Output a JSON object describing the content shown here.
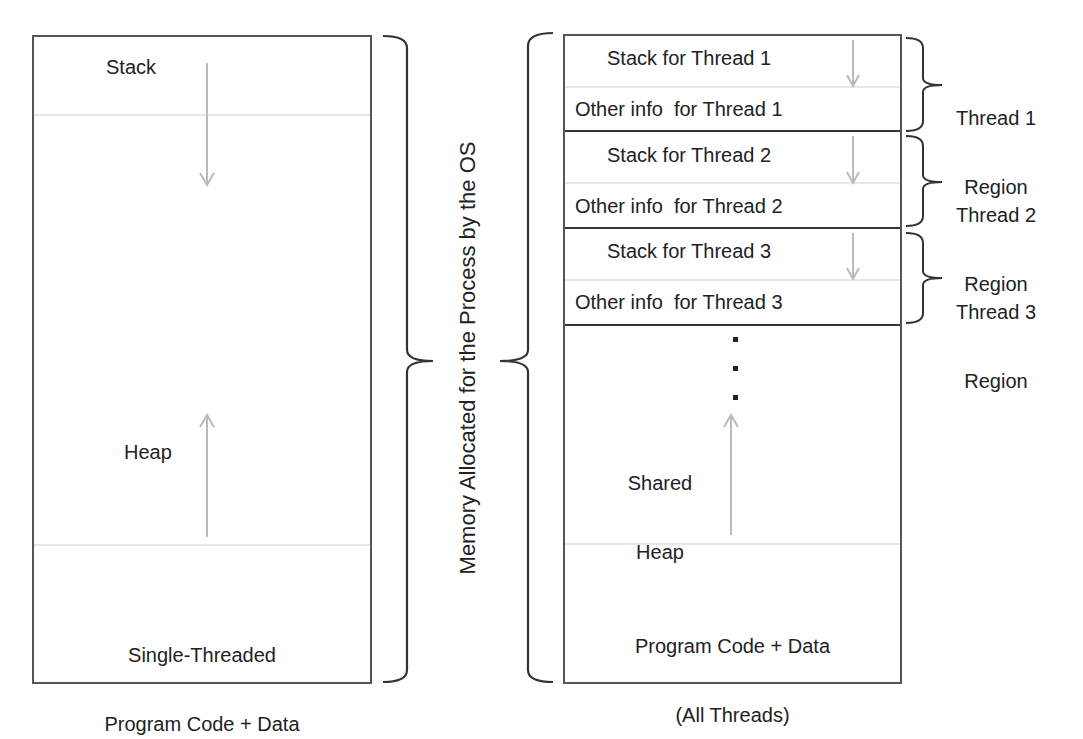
{
  "diagram": {
    "title_vertical": "Memory Allocated for the Process by the OS",
    "single_threaded": {
      "stack_label": "Stack",
      "heap_label": "Heap",
      "code_label_line1": "Single-Threaded",
      "code_label_line2": "Program Code + Data"
    },
    "multi_threaded": {
      "threads": [
        {
          "stack_label": "Stack for Thread 1",
          "other_label": "Other info  for Thread 1",
          "region_line1": "Thread 1",
          "region_line2": "Region"
        },
        {
          "stack_label": "Stack for Thread 2",
          "other_label": "Other info  for Thread 2",
          "region_line1": "Thread 2",
          "region_line2": "Region"
        },
        {
          "stack_label": "Stack for Thread 3",
          "other_label": "Other info  for Thread 3",
          "region_line1": "Thread 3",
          "region_line2": "Region"
        }
      ],
      "ellipsis": "⋮",
      "heap_line1": "Shared",
      "heap_line2": "Heap",
      "code_line1": "Program Code + Data",
      "code_line2": "(All Threads)"
    },
    "colors": {
      "box_border": "#555555",
      "divider_light": "#c8c8c8",
      "thread_border": "#333333",
      "arrow": "#bbbbbb",
      "brace": "#333333"
    }
  }
}
